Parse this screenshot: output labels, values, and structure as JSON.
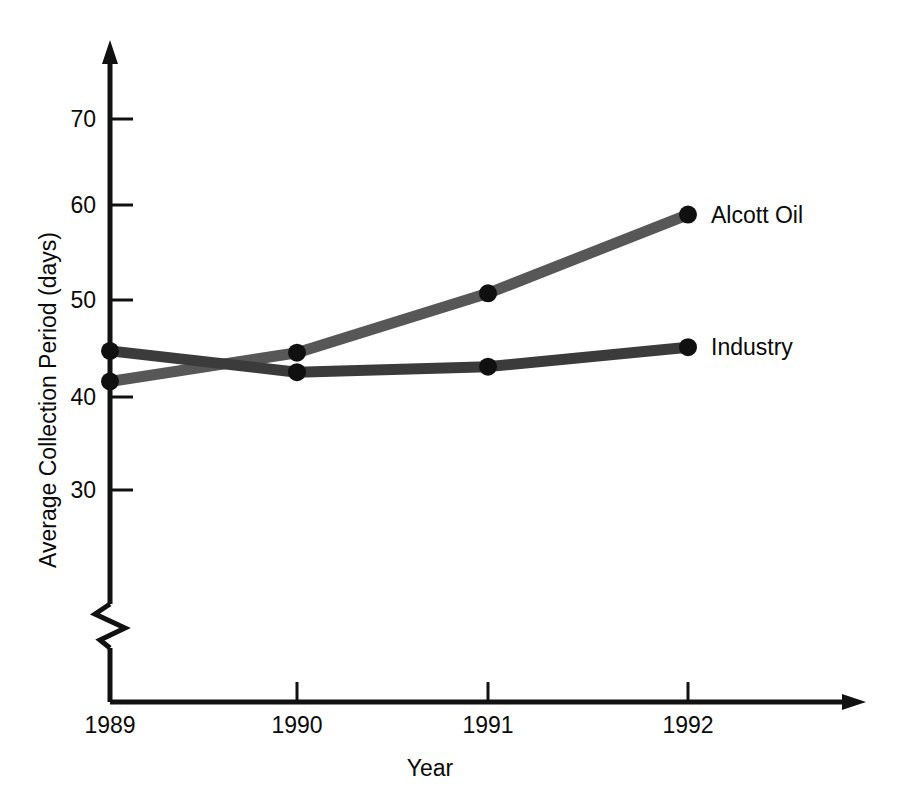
{
  "chart_data": {
    "type": "line",
    "title": "",
    "subtitle": "",
    "xlabel": "Year",
    "ylabel": "Average Collection Period (days)",
    "categories": [
      "1989",
      "1990",
      "1991",
      "1992"
    ],
    "x": [
      1989,
      1990,
      1991,
      1992
    ],
    "xlim": [
      1989,
      1992
    ],
    "ylim": [
      30,
      70
    ],
    "y_ticks": [
      30,
      40,
      50,
      60,
      70
    ],
    "y_tick_labels": [
      "30",
      "40",
      "50",
      "60",
      "70"
    ],
    "x_ticks": [
      1989,
      1990,
      1991,
      1992
    ],
    "x_tick_labels": [
      "1989",
      "1990",
      "1991",
      "1992"
    ],
    "grid": false,
    "axis_break": true,
    "axis_break_note": "zigzag break on y-axis below 30",
    "legend_position": "right-inline-end-of-line",
    "series": [
      {
        "name": "Alcott Oil",
        "values": [
          41.7,
          44.8,
          51.2,
          59.7
        ],
        "color": "#575757",
        "marker": "circle"
      },
      {
        "name": "Industry",
        "values": [
          45.0,
          42.7,
          43.3,
          45.4
        ],
        "color": "#3b3b3b",
        "marker": "circle"
      }
    ],
    "annotations": [
      {
        "text": "Alcott Oil",
        "at_x": 1992,
        "at_y": 59.7
      },
      {
        "text": "Industry",
        "at_x": 1992,
        "at_y": 45.4
      }
    ]
  },
  "colors": {
    "axis": "#111111",
    "background": "#ffffff",
    "alcott": "#575757",
    "industry": "#3b3b3b"
  }
}
